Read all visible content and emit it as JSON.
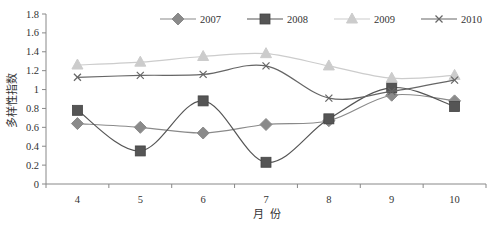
{
  "chart_data": {
    "type": "line",
    "title": "",
    "xlabel": "月  份",
    "ylabel": "多样性指数",
    "categories": [
      "4",
      "5",
      "6",
      "7",
      "8",
      "9",
      "10"
    ],
    "ylim": [
      0,
      1.8
    ],
    "yticks": [
      "0",
      "0.2",
      "0.4",
      "0.6",
      "0.8",
      "1",
      "1.2",
      "1.4",
      "1.6",
      "1.8"
    ],
    "grid": false,
    "legend_position": "top",
    "smooth": true,
    "series": [
      {
        "name": "2007",
        "marker": "diamond",
        "color": "#8a8a8a",
        "values": [
          0.64,
          0.6,
          0.54,
          0.63,
          0.67,
          0.94,
          0.88
        ]
      },
      {
        "name": "2008",
        "marker": "square",
        "color": "#555555",
        "values": [
          0.78,
          0.35,
          0.88,
          0.23,
          0.69,
          1.02,
          0.82
        ]
      },
      {
        "name": "2009",
        "marker": "triangle",
        "color": "#cccccc",
        "values": [
          1.26,
          1.29,
          1.35,
          1.38,
          1.25,
          1.12,
          1.15
        ]
      },
      {
        "name": "2010",
        "marker": "x",
        "color": "#666666",
        "values": [
          1.13,
          1.15,
          1.16,
          1.25,
          0.91,
          0.98,
          1.1
        ]
      }
    ]
  }
}
